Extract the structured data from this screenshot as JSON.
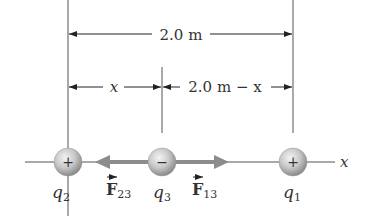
{
  "diagram": {
    "dimensions": {
      "total": "2.0 m",
      "left": "x",
      "right": "2.0 m − x"
    },
    "axis_label": "x",
    "charges": [
      {
        "id": "q2",
        "symbol": "q",
        "subscript": "2",
        "sign": "+",
        "x": 68
      },
      {
        "id": "q3",
        "symbol": "q",
        "subscript": "3",
        "sign": "−",
        "x": 162
      },
      {
        "id": "q1",
        "symbol": "q",
        "subscript": "1",
        "sign": "+",
        "x": 293
      }
    ],
    "forces": [
      {
        "id": "F23",
        "symbol": "F",
        "subscript": "23",
        "direction": "left"
      },
      {
        "id": "F13",
        "symbol": "F",
        "subscript": "13",
        "direction": "right"
      }
    ],
    "colors": {
      "line": "#555555",
      "force_arrow": "#8c8c8c",
      "sphere_light": "#eeeeee",
      "sphere_dark": "#9a9a9a",
      "text": "#333333"
    }
  }
}
